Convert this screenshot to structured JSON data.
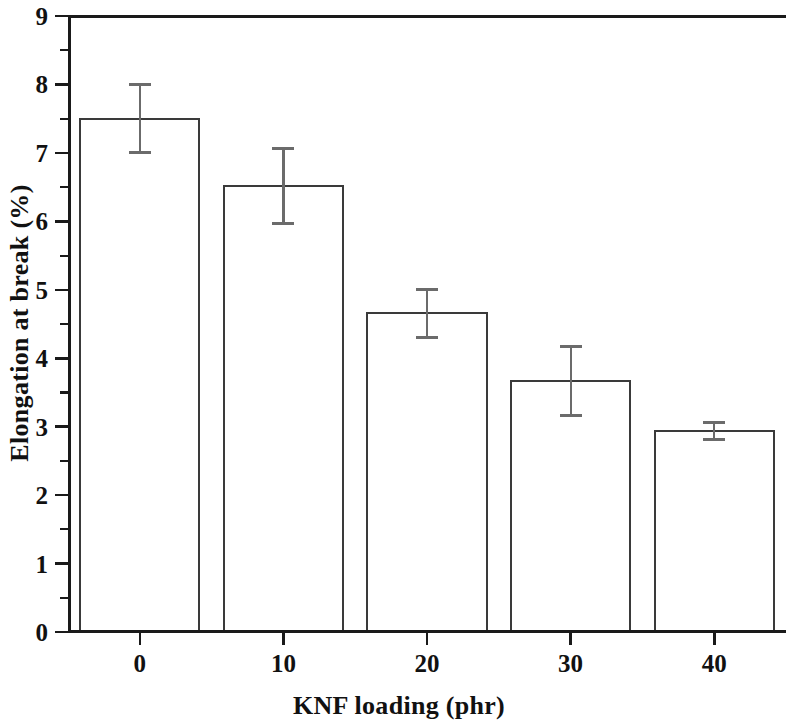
{
  "chart_data": {
    "type": "bar",
    "title": "",
    "xlabel": "KNF loading (phr)",
    "ylabel": "Elongation at break (%)",
    "categories": [
      "0",
      "10",
      "20",
      "30",
      "40"
    ],
    "x": [
      0,
      10,
      20,
      30,
      40
    ],
    "values": [
      7.5,
      6.52,
      4.66,
      3.67,
      2.94
    ],
    "errors": [
      0.5,
      0.55,
      0.35,
      0.5,
      0.12
    ],
    "series": [
      {
        "name": "Elongation at break",
        "values": [
          7.5,
          6.52,
          4.66,
          3.67,
          2.94
        ],
        "errors": [
          0.5,
          0.55,
          0.35,
          0.5,
          0.12
        ]
      }
    ],
    "ylim": [
      0,
      9
    ],
    "xlim": [
      -5,
      45
    ],
    "ytick_labels": [
      "0",
      "1",
      "2",
      "3",
      "4",
      "5",
      "6",
      "7",
      "8",
      "9"
    ],
    "ytick_values": [
      0,
      1,
      2,
      3,
      4,
      5,
      6,
      7,
      8,
      9
    ],
    "yminor_step": 0.5,
    "xtick_labels": [
      "0",
      "10",
      "20",
      "30",
      "40"
    ],
    "xtick_values": [
      0,
      10,
      20,
      30,
      40
    ],
    "grid": false,
    "legend": false,
    "legend_position": "none",
    "bar_fill_color": "#ffffff",
    "bar_edge_color": "#3a3a3a",
    "error_bar_color": "#6b6b6b",
    "axis_color": "#1a1a1a",
    "background_color": "#ffffff",
    "tick_direction": "out",
    "spines": [
      "left",
      "top",
      "bottom"
    ]
  }
}
